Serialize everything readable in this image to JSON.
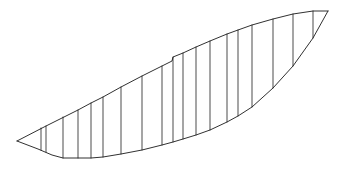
{
  "figure": {
    "name": "hull-profile-line-drawing",
    "kind": "technical-line-drawing",
    "background_color": "#ffffff",
    "outline_color": "#1a1a1a",
    "station_color": "#2b2b2b",
    "width": 339,
    "height": 175
  },
  "geometry": {
    "stern_tip": [
      17,
      141
    ],
    "bow_tip": [
      328,
      11
    ],
    "sheer_line": "M 17 141 L 46 126 L 64 117 L 78 110 L 91 103 L 103 97 L 121 87 L 142 76 L 162 66 L 172 61 L 173 57 L 183 53 L 196 47 L 210 41 L 227 34 L 238 30 L 252 25 L 273 19 L 293 14 L 313 11 L 328 11",
    "keel_line": "M 17 141 L 38 149 L 52 155 L 63 158 L 78 158 L 91 158 L 103 157 L 121 154 L 142 150 L 162 145 L 173 142 L 183 139 L 196 135 L 210 130 L 227 122 L 238 116 L 252 107 L 273 88 L 293 66 L 313 38 L 328 11",
    "station_count": 18,
    "stations": [
      {
        "x": 41,
        "y_top": 128,
        "y_bottom": 150
      },
      {
        "x": 46,
        "y_top": 126,
        "y_bottom": 152
      },
      {
        "x": 63,
        "y_top": 117,
        "y_bottom": 158
      },
      {
        "x": 78,
        "y_top": 110,
        "y_bottom": 158
      },
      {
        "x": 91,
        "y_top": 103,
        "y_bottom": 158
      },
      {
        "x": 103,
        "y_top": 97,
        "y_bottom": 157
      },
      {
        "x": 121,
        "y_top": 87,
        "y_bottom": 154
      },
      {
        "x": 142,
        "y_top": 76,
        "y_bottom": 150
      },
      {
        "x": 162,
        "y_top": 66,
        "y_bottom": 145
      },
      {
        "x": 173,
        "y_top": 57,
        "y_bottom": 142
      },
      {
        "x": 183,
        "y_top": 53,
        "y_bottom": 139
      },
      {
        "x": 196,
        "y_top": 47,
        "y_bottom": 135
      },
      {
        "x": 210,
        "y_top": 41,
        "y_bottom": 130
      },
      {
        "x": 227,
        "y_top": 34,
        "y_bottom": 122
      },
      {
        "x": 238,
        "y_top": 30,
        "y_bottom": 116
      },
      {
        "x": 252,
        "y_top": 25,
        "y_bottom": 107
      },
      {
        "x": 273,
        "y_top": 19,
        "y_bottom": 88
      },
      {
        "x": 293,
        "y_top": 14,
        "y_bottom": 66
      },
      {
        "x": 313,
        "y_top": 11,
        "y_bottom": 38
      }
    ]
  },
  "caption": {
    "visible_fragment": ""
  }
}
